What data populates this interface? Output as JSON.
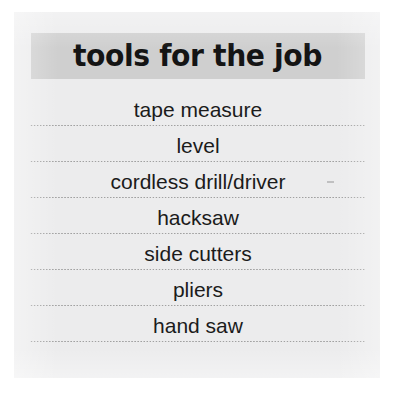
{
  "document": {
    "card_background": "#ececed",
    "page_background": "#ffffff"
  },
  "header": {
    "title": "tools for the job",
    "banner_color": "#cfcfcf",
    "text_color": "#141414"
  },
  "list": {
    "separator_style": "dotted",
    "separator_color": "#9a9a9a",
    "items": [
      {
        "label": "tape measure"
      },
      {
        "label": "level"
      },
      {
        "label": "cordless drill/driver"
      },
      {
        "label": "hacksaw"
      },
      {
        "label": "side cutters"
      },
      {
        "label": "pliers"
      },
      {
        "label": "hand saw"
      }
    ]
  }
}
